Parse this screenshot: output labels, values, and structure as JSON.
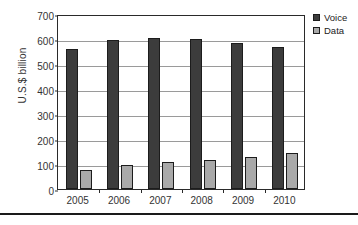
{
  "chart_data": {
    "type": "bar",
    "title": "",
    "subtitle": "",
    "xlabel": "",
    "ylabel": "U.S.$ billion",
    "categories": [
      "2005",
      "2006",
      "2007",
      "2008",
      "2009",
      "2010"
    ],
    "series": [
      {
        "name": "Voice",
        "color": "#3c3c3c",
        "values": [
          560,
          597,
          605,
          600,
          586,
          567
        ]
      },
      {
        "name": "Data",
        "color": "#a9a9a9",
        "values": [
          78,
          95,
          107,
          117,
          129,
          143
        ]
      }
    ],
    "ylim": [
      0,
      700
    ],
    "yticks": [
      0,
      100,
      200,
      300,
      400,
      500,
      600,
      700
    ],
    "ytick_labels": [
      "0",
      "100",
      "200",
      "300",
      "400",
      "500",
      "600",
      "700"
    ],
    "grid": true,
    "grid_axis": "y",
    "legend": [
      "Voice",
      "Data"
    ],
    "legend_position": "top-right",
    "annotations": []
  },
  "legend": {
    "entries": [
      {
        "label": "Voice",
        "swatch": "legend-swatch-voice"
      },
      {
        "label": "Data",
        "swatch": "legend-swatch-data"
      }
    ]
  }
}
